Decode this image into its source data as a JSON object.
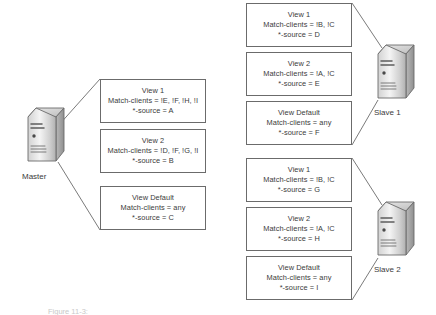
{
  "diagram": {
    "caption": "Figure 11-3:",
    "line_color": "#6b6b6b",
    "text_color": "#3b3b3b",
    "background": "#ffffff"
  },
  "servers": [
    {
      "id": "master",
      "label": "Master",
      "icon": "server-tower-icon"
    },
    {
      "id": "slave1",
      "label": "Slave 1",
      "icon": "server-tower-icon"
    },
    {
      "id": "slave2",
      "label": "Slave 2",
      "icon": "server-tower-icon"
    }
  ],
  "groups": [
    {
      "id": "master-views",
      "owner": "Master",
      "boxes": [
        {
          "name": "View 1",
          "match_clients": "Match-clients = !E, !F, !H, !I",
          "source": "*-source = A"
        },
        {
          "name": "View 2",
          "match_clients": "Match-clients = !D, !F, !G, !I",
          "source": "*-source = B"
        },
        {
          "name": "View Default",
          "match_clients": "Match-clients = any",
          "source": "*-source = C"
        }
      ]
    },
    {
      "id": "slave1-views",
      "owner": "Slave 1",
      "boxes": [
        {
          "name": "View 1",
          "match_clients": "Match-clients = !B, !C",
          "source": "*-source = D"
        },
        {
          "name": "View 2",
          "match_clients": "Match-clients = !A, !C",
          "source": "*-source = E"
        },
        {
          "name": "View Default",
          "match_clients": "Match-clients = any",
          "source": "*-source = F"
        }
      ]
    },
    {
      "id": "slave2-views",
      "owner": "Slave 2",
      "boxes": [
        {
          "name": "View 1",
          "match_clients": "Match-clients = !B, !C",
          "source": "*-source = G"
        },
        {
          "name": "View 2",
          "match_clients": "Match-clients = !A, !C",
          "source": "*-source = H"
        },
        {
          "name": "View Default",
          "match_clients": "Match-clients = any",
          "source": "*-source = I"
        }
      ]
    }
  ]
}
